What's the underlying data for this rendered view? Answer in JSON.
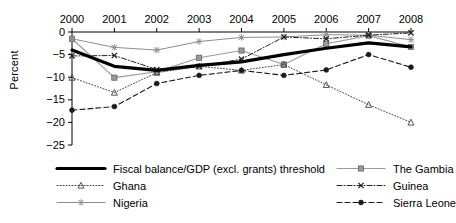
{
  "chart_data": {
    "type": "line",
    "title": "",
    "subtitle": "",
    "xlabel": "",
    "ylabel": "Percent",
    "x": [
      2000,
      2001,
      2002,
      2003,
      2004,
      2005,
      2006,
      2007,
      2008
    ],
    "categories": [
      "2000",
      "2001",
      "2002",
      "2003",
      "2004",
      "2005",
      "2006",
      "2007",
      "2008"
    ],
    "xlim": [
      2000,
      2008
    ],
    "ylim": [
      -25,
      0
    ],
    "yticks": [
      0,
      -5,
      -10,
      -15,
      -20,
      -25
    ],
    "ytick_labels": [
      "0",
      "−5",
      "−10",
      "−15",
      "−20",
      "−25"
    ],
    "grid": false,
    "axis_position": "x-axis at top",
    "legend_position": "bottom",
    "legend_columns": 2,
    "series": [
      {
        "name": "Fiscal balance/GDP (excl. grants) threshold",
        "values": [
          -4.0,
          -7.6,
          -8.5,
          -7.4,
          -6.6,
          -5.0,
          -3.6,
          -2.4,
          -3.3
        ],
        "color": "#000000",
        "line_style": "solid",
        "line_width": 3.2,
        "marker": "none"
      },
      {
        "name": "The Gambia",
        "values": [
          -1.5,
          -10.1,
          -8.8,
          -5.7,
          -4.1,
          -7.2,
          -2.6,
          -0.8,
          -3.3
        ],
        "color": "#9a9a9a",
        "line_style": "solid",
        "line_width": 1.1,
        "marker": "square"
      },
      {
        "name": "Ghana",
        "values": [
          -10.1,
          -13.4,
          -9.0,
          -7.6,
          -8.5,
          -7.2,
          -11.7,
          -16.1,
          -20.0
        ],
        "color": "#444444",
        "line_style": "dotted",
        "line_width": 1.0,
        "marker": "triangle"
      },
      {
        "name": "Guinea",
        "values": [
          -5.3,
          -5.2,
          -8.3,
          -7.6,
          -6.0,
          -1.1,
          -1.5,
          -0.7,
          -0.2
        ],
        "color": "#222222",
        "line_style": "dashdot",
        "line_width": 1.0,
        "marker": "x"
      },
      {
        "name": "Nigeria",
        "values": [
          -1.5,
          -3.4,
          -4.0,
          -2.1,
          -1.2,
          -1.1,
          -0.6,
          -0.7,
          -1.7
        ],
        "color": "#8d8d8d",
        "line_style": "solid",
        "line_width": 1.0,
        "marker": "asterisk"
      },
      {
        "name": "Sierra Leone",
        "values": [
          -17.3,
          -16.5,
          -11.4,
          -9.6,
          -8.5,
          -9.6,
          -8.4,
          -5.0,
          -7.8
        ],
        "color": "#1a1a1a",
        "line_style": "dashed",
        "line_width": 1.1,
        "marker": "circle"
      }
    ]
  },
  "axes": {
    "y_axis_title": "Percent"
  },
  "legend": {
    "left_column": [
      {
        "label": "Fiscal balance/GDP (excl. grants) threshold",
        "series_index": 0
      },
      {
        "label": "Ghana",
        "series_index": 2
      },
      {
        "label": "Nigeria",
        "series_index": 4
      }
    ],
    "right_column": [
      {
        "label": "The Gambia",
        "series_index": 1
      },
      {
        "label": "Guinea",
        "series_index": 3
      },
      {
        "label": "Sierra Leone",
        "series_index": 5
      }
    ]
  }
}
